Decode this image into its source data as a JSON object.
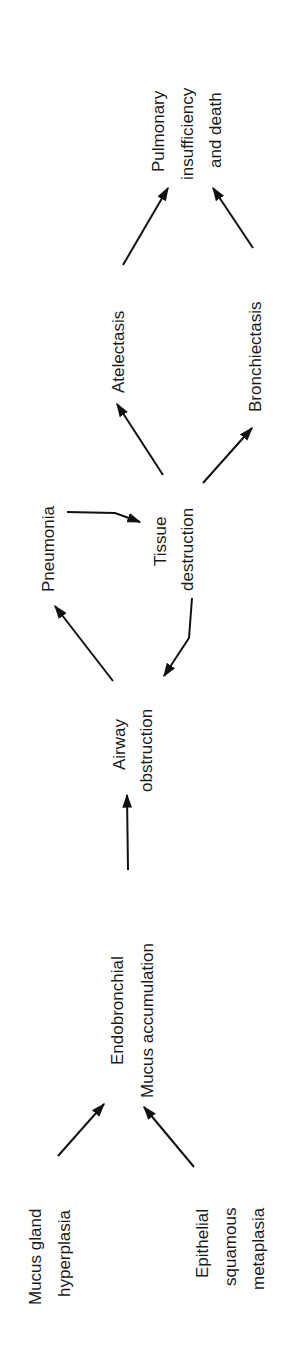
{
  "diagram": {
    "orientation": "rotated-90-ccw",
    "nodes": {
      "mucus_gland": {
        "lines": [
          "Mucus gland",
          "hyperplasia"
        ]
      },
      "epithelial": {
        "lines": [
          "Epithelial",
          "squamous",
          "metaplasia"
        ]
      },
      "endobronchial": {
        "lines": [
          "Endobronchial",
          "Mucus accumulation"
        ]
      },
      "airway": {
        "lines": [
          "Airway",
          "obstruction"
        ]
      },
      "pneumonia": {
        "lines": [
          "Pneumonia"
        ]
      },
      "tissue": {
        "lines": [
          "Tissue",
          "destruction"
        ]
      },
      "atelectasis": {
        "lines": [
          "Atelectasis"
        ]
      },
      "bronchiectasis": {
        "lines": [
          "Bronchiectasis"
        ]
      },
      "pulmonary": {
        "lines": [
          "Pulmonary",
          "insufficiency",
          "and death"
        ]
      }
    },
    "edges": [
      {
        "from": "Mucus gland hyperplasia",
        "to": "Endobronchial Mucus accumulation"
      },
      {
        "from": "Epithelial squamous metaplasia",
        "to": "Endobronchial Mucus accumulation"
      },
      {
        "from": "Endobronchial Mucus accumulation",
        "to": "Airway obstruction"
      },
      {
        "from": "Airway obstruction",
        "to": "Pneumonia"
      },
      {
        "from": "Pneumonia",
        "to": "Tissue destruction"
      },
      {
        "from": "Tissue destruction",
        "to": "Airway obstruction"
      },
      {
        "from": "Tissue destruction",
        "to": "Atelectasis"
      },
      {
        "from": "Tissue destruction",
        "to": "Bronchiectasis"
      },
      {
        "from": "Atelectasis",
        "to": "Pulmonary insufficiency and death"
      },
      {
        "from": "Bronchiectasis",
        "to": "Pulmonary insufficiency and death"
      }
    ]
  }
}
